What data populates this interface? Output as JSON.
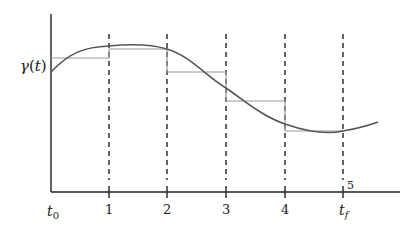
{
  "diagram": {
    "type": "piecewise-constant approximation of a curve",
    "y_label": "γ(t)",
    "y_label_parts": {
      "base": "γ",
      "open": "(",
      "var": "t",
      "close": ")"
    },
    "x_axis": {
      "start_label": {
        "base": "t",
        "sub": "0"
      },
      "tick_labels": [
        "1",
        "2",
        "3",
        "4"
      ],
      "end_label": {
        "base": "t",
        "sub": "f"
      },
      "end_index_label": "5"
    },
    "colors": {
      "axis": "#222222",
      "curve": "#555555",
      "steps": "#999999",
      "dashed": "#222222"
    },
    "intervals": [
      {
        "from": "t0",
        "to": "1",
        "level": "γ(t0)"
      },
      {
        "from": "1",
        "to": "2",
        "level": "γ(1)"
      },
      {
        "from": "2",
        "to": "3",
        "level": "γ(2)"
      },
      {
        "from": "3",
        "to": "4",
        "level": "γ(3)"
      },
      {
        "from": "4",
        "to": "5",
        "level": "γ(4)"
      }
    ]
  }
}
